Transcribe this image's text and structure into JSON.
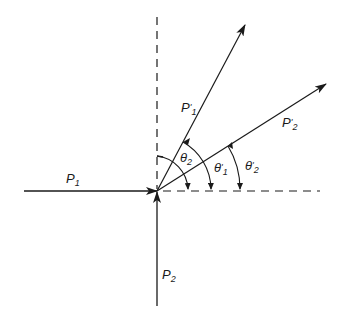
{
  "diagram": {
    "type": "vector collision diagram",
    "colors": {
      "line": "#1a1a1a",
      "background": "#ffffff"
    },
    "labels": {
      "p1": {
        "main": "P",
        "prime": "",
        "sub": "1"
      },
      "p2": {
        "main": "P",
        "prime": "",
        "sub": "2"
      },
      "p1_prime": {
        "main": "P",
        "prime": "'",
        "sub": "1"
      },
      "p2_prime": {
        "main": "P",
        "prime": "'",
        "sub": "2"
      },
      "theta2": {
        "main": "θ",
        "prime": "",
        "sub": "2"
      },
      "theta1_prime": {
        "main": "θ",
        "prime": "'",
        "sub": "1"
      },
      "theta2_prime": {
        "main": "θ",
        "prime": "'",
        "sub": "2"
      }
    },
    "vectors": [
      {
        "name": "P1",
        "from": [
          24,
          191
        ],
        "to": [
          157,
          191
        ],
        "style": "solid"
      },
      {
        "name": "P2",
        "from": [
          157,
          306
        ],
        "to": [
          157,
          191
        ],
        "style": "solid"
      },
      {
        "name": "P'1",
        "from": [
          157,
          191
        ],
        "to": [
          245,
          25
        ],
        "style": "solid"
      },
      {
        "name": "P'2",
        "from": [
          157,
          191
        ],
        "to": [
          326,
          84
        ],
        "style": "solid"
      }
    ],
    "reference_axes": [
      {
        "name": "vertical",
        "from": [
          157,
          17
        ],
        "to": [
          157,
          191
        ],
        "style": "dashed"
      },
      {
        "name": "horizontal",
        "from": [
          157,
          191
        ],
        "to": [
          320,
          191
        ],
        "style": "dashed"
      }
    ],
    "angles": [
      {
        "name": "θ2",
        "from": "vertical axis",
        "to": "horizontal axis"
      },
      {
        "name": "θ'1",
        "from": "P'1",
        "to": "horizontal axis"
      },
      {
        "name": "θ'2",
        "from": "P'2",
        "to": "horizontal axis"
      }
    ]
  }
}
